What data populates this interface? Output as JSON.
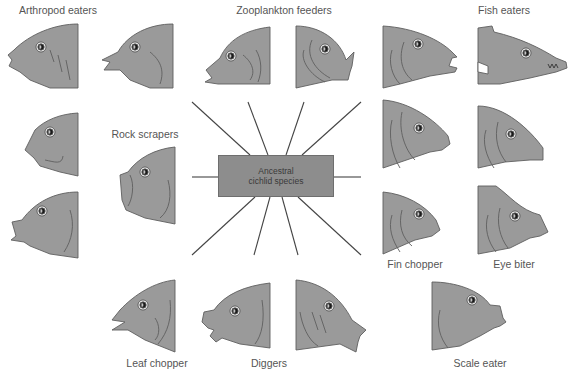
{
  "center": {
    "line1": "Ancestral",
    "line2": "cichlid species"
  },
  "colors": {
    "fish_fill": "#9a9a9a",
    "fish_stroke": "#5f5f5f",
    "line": "#444444",
    "box": "#8d8d8d",
    "label": "#555555"
  },
  "groups": [
    {
      "id": "arthropod",
      "label": "Arthropod eaters",
      "x": 58,
      "y": 10
    },
    {
      "id": "zooplankton",
      "label": "Zooplankton feeders",
      "x": 284,
      "y": 10
    },
    {
      "id": "fish",
      "label": "Fish eaters",
      "x": 504,
      "y": 10
    },
    {
      "id": "rock",
      "label": "Rock scrapers",
      "x": 145,
      "y": 100
    },
    {
      "id": "fin",
      "label": "Fin chopper",
      "x": 415,
      "y": 258
    },
    {
      "id": "eye",
      "label": "Eye biter",
      "x": 514,
      "y": 258
    },
    {
      "id": "leaf",
      "label": "Leaf chopper",
      "x": 157,
      "y": 357
    },
    {
      "id": "diggers",
      "label": "Diggers",
      "x": 269,
      "y": 357
    },
    {
      "id": "scale",
      "label": "Scale eater",
      "x": 480,
      "y": 357
    }
  ]
}
